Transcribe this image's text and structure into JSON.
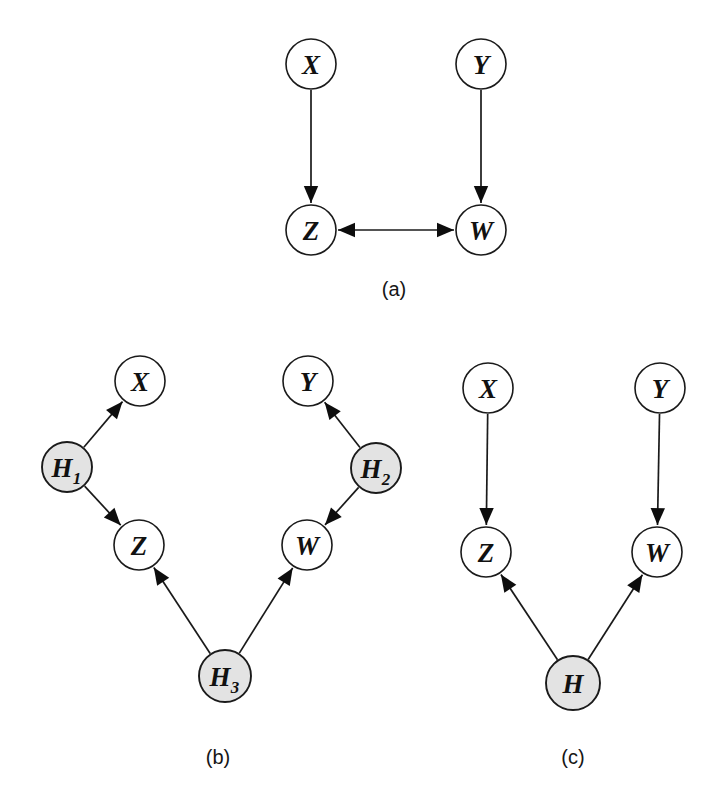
{
  "figure": {
    "background_color": "#ffffff",
    "ink_color": "#1a1a1a",
    "latent_fill_color": "#e3e3e3",
    "observed_fill_color": "#ffffff",
    "panels": [
      {
        "id": "a",
        "caption": "(a)",
        "caption_pos": {
          "x": 394,
          "y": 289
        },
        "nodes": [
          {
            "id": "a_X",
            "label": "X",
            "sub": "",
            "kind": "observed",
            "x": 311,
            "y": 64,
            "r": 25
          },
          {
            "id": "a_Y",
            "label": "Y",
            "sub": "",
            "kind": "observed",
            "x": 481,
            "y": 64,
            "r": 25
          },
          {
            "id": "a_Z",
            "label": "Z",
            "sub": "",
            "kind": "observed",
            "x": 311,
            "y": 230,
            "r": 25
          },
          {
            "id": "a_W",
            "label": "W",
            "sub": "",
            "kind": "observed",
            "x": 481,
            "y": 230,
            "r": 25
          }
        ],
        "edges": [
          {
            "from": "a_X",
            "to": "a_Z",
            "type": "directed"
          },
          {
            "from": "a_Y",
            "to": "a_W",
            "type": "directed"
          },
          {
            "from": "a_W",
            "to": "a_Z",
            "type": "bidirected"
          }
        ]
      },
      {
        "id": "b",
        "caption": "(b)",
        "caption_pos": {
          "x": 218,
          "y": 757
        },
        "nodes": [
          {
            "id": "b_X",
            "label": "X",
            "sub": "",
            "kind": "observed",
            "x": 140,
            "y": 381,
            "r": 25
          },
          {
            "id": "b_Y",
            "label": "Y",
            "sub": "",
            "kind": "observed",
            "x": 308,
            "y": 381,
            "r": 25
          },
          {
            "id": "b_H1",
            "label": "H",
            "sub": "1",
            "kind": "latent",
            "x": 67,
            "y": 467,
            "r": 25
          },
          {
            "id": "b_H2",
            "label": "H",
            "sub": "2",
            "kind": "latent",
            "x": 376,
            "y": 468,
            "r": 25
          },
          {
            "id": "b_Z",
            "label": "Z",
            "sub": "",
            "kind": "observed",
            "x": 139,
            "y": 545,
            "r": 25
          },
          {
            "id": "b_W",
            "label": "W",
            "sub": "",
            "kind": "observed",
            "x": 307,
            "y": 545,
            "r": 25
          },
          {
            "id": "b_H3",
            "label": "H",
            "sub": "3",
            "kind": "latent",
            "x": 225,
            "y": 676,
            "r": 26
          }
        ],
        "edges": [
          {
            "from": "b_H1",
            "to": "b_X",
            "type": "directed"
          },
          {
            "from": "b_H1",
            "to": "b_Z",
            "type": "directed"
          },
          {
            "from": "b_H2",
            "to": "b_Y",
            "type": "directed"
          },
          {
            "from": "b_H2",
            "to": "b_W",
            "type": "directed"
          },
          {
            "from": "b_H3",
            "to": "b_Z",
            "type": "directed"
          },
          {
            "from": "b_H3",
            "to": "b_W",
            "type": "directed"
          }
        ]
      },
      {
        "id": "c",
        "caption": "(c)",
        "caption_pos": {
          "x": 573,
          "y": 757
        },
        "nodes": [
          {
            "id": "c_X",
            "label": "X",
            "sub": "",
            "kind": "observed",
            "x": 488,
            "y": 388,
            "r": 25
          },
          {
            "id": "c_Y",
            "label": "Y",
            "sub": "",
            "kind": "observed",
            "x": 660,
            "y": 388,
            "r": 25
          },
          {
            "id": "c_Z",
            "label": "Z",
            "sub": "",
            "kind": "observed",
            "x": 486,
            "y": 552,
            "r": 25
          },
          {
            "id": "c_W",
            "label": "W",
            "sub": "",
            "kind": "observed",
            "x": 657,
            "y": 552,
            "r": 25
          },
          {
            "id": "c_H",
            "label": "H",
            "sub": "",
            "kind": "latent",
            "x": 573,
            "y": 683,
            "r": 27
          }
        ],
        "edges": [
          {
            "from": "c_X",
            "to": "c_Z",
            "type": "directed"
          },
          {
            "from": "c_Y",
            "to": "c_W",
            "type": "directed"
          },
          {
            "from": "c_H",
            "to": "c_Z",
            "type": "directed"
          },
          {
            "from": "c_H",
            "to": "c_W",
            "type": "directed"
          }
        ]
      }
    ]
  }
}
